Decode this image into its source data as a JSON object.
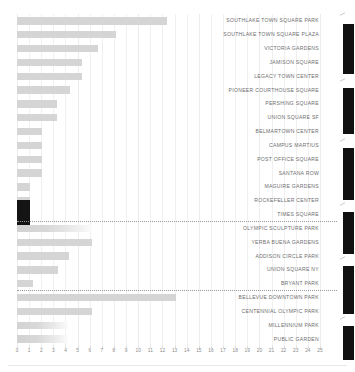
{
  "chart_data": {
    "type": "bar",
    "orientation": "horizontal",
    "title": "",
    "subtitle": "",
    "xlabel": "",
    "ylabel": "",
    "xlim": [
      0,
      25
    ],
    "grid": true,
    "legend": "none",
    "tick_labels": [
      "0",
      "1",
      "2",
      "3",
      "4",
      "5",
      "6",
      "7",
      "8",
      "9",
      "10",
      "11",
      "12",
      "13",
      "14",
      "15",
      "16",
      "17",
      "18",
      "19",
      "20",
      "21",
      "22",
      "23",
      "24",
      "25"
    ],
    "highlight_color": "#141414",
    "bar_color": "#d5d5d5",
    "categories": [
      "SOUTHLAKE TOWN SQUARE PARK",
      "SOUTHLAKE TOWN SQUARE PLAZA",
      "VICTORIA GARDENS",
      "JAMISON SQUARE",
      "LEGACY TOWN CENTER",
      "PIONEER COURTHOUSE SQUARE",
      "PERSHING SQUARE",
      "UNION SQUARE SF",
      "BELMARTOWN CENTER",
      "CAMPUS MARTIUS",
      "POST OFFICE SQUARE",
      "SANTANA ROW",
      "MAGUIRE GARDENS",
      "ROCKEFELLER CENTER",
      "TIMES SQUARE",
      "OLYMPIC SCULPTURE PARK",
      "YERBA BUENA GARDENS",
      "ADDISON CIRCLE PARK",
      "UNION SQUARE NY",
      "BRYANT PARK",
      "BELLEVUE DOWNTOWN PARK",
      "CENTENNIAL OLYMPIC PARK",
      "MILLENNIUM PARK",
      "PUBLIC GARDEN"
    ],
    "values": [
      12.4,
      8.2,
      6.7,
      5.4,
      5.4,
      4.4,
      3.3,
      3.3,
      2.1,
      2.1,
      2.1,
      2.1,
      1.1,
      1.1,
      1.1,
      6.2,
      6.2,
      4.3,
      3.4,
      1.3,
      13.1,
      6.2,
      4.2,
      4.2
    ],
    "highlighted": [
      "TIMES SQUARE"
    ],
    "group_separators_after": [
      "TIMES SQUARE",
      "BRYANT PARK"
    ],
    "groups": [
      {
        "name": "group-1",
        "categories": [
          "SOUTHLAKE TOWN SQUARE PARK",
          "SOUTHLAKE TOWN SQUARE PLAZA",
          "VICTORIA GARDENS",
          "JAMISON SQUARE",
          "LEGACY TOWN CENTER",
          "PIONEER COURTHOUSE SQUARE",
          "PERSHING SQUARE",
          "UNION SQUARE SF",
          "BELMARTOWN CENTER",
          "CAMPUS MARTIUS",
          "POST OFFICE SQUARE",
          "SANTANA ROW",
          "MAGUIRE GARDENS",
          "ROCKEFELLER CENTER",
          "TIMES SQUARE"
        ]
      },
      {
        "name": "group-2",
        "categories": [
          "OLYMPIC SCULPTURE PARK",
          "YERBA BUENA GARDENS",
          "ADDISON CIRCLE PARK",
          "UNION SQUARE NY",
          "BRYANT PARK"
        ]
      },
      {
        "name": "group-3",
        "categories": [
          "BELLEVUE DOWNTOWN PARK",
          "CENTENNIAL OLYMPIC PARK",
          "MILLENNIUM PARK",
          "PUBLIC GARDEN"
        ]
      }
    ]
  }
}
